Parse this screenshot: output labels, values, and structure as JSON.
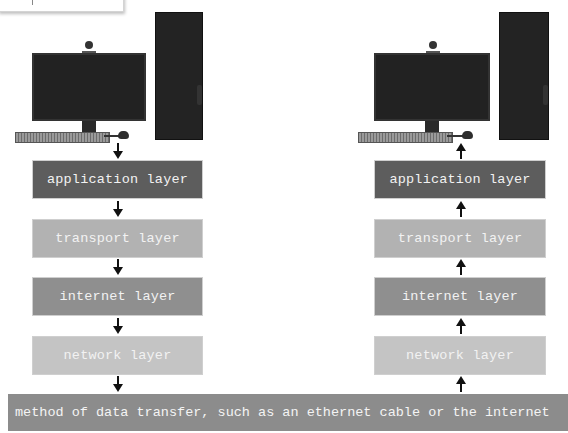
{
  "diagram": {
    "sender": {
      "layers": [
        {
          "label": "application layer"
        },
        {
          "label": "transport layer"
        },
        {
          "label": "internet layer"
        },
        {
          "label": "network layer"
        }
      ],
      "arrow_direction": "down"
    },
    "receiver": {
      "layers": [
        {
          "label": "application layer"
        },
        {
          "label": "transport layer"
        },
        {
          "label": "internet layer"
        },
        {
          "label": "network layer"
        }
      ],
      "arrow_direction": "up"
    },
    "medium": {
      "label": "method of data transfer, such as an ethernet cable or the internet"
    },
    "colors": {
      "application": "#5d5d5d",
      "transport": "#b2b2b2",
      "internet": "#8f8f8f",
      "network": "#c4c4c4",
      "medium": "#8c8c8c",
      "arrow": "#111111"
    }
  }
}
